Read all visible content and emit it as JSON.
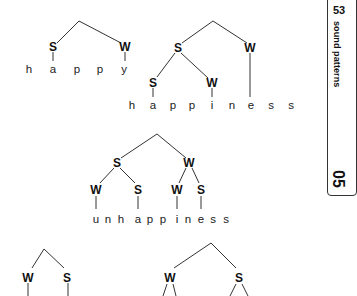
{
  "page": {
    "number": "53",
    "section_title": "sound patterns",
    "chapter": "05"
  },
  "trees": [
    {
      "word": "happy",
      "nodes": {
        "l": "S",
        "r": "W"
      },
      "segments": [
        "h",
        "a",
        "p",
        "p",
        "y"
      ]
    },
    {
      "word": "happiness",
      "nodes": {
        "l": "S",
        "r": "W",
        "ll": "S",
        "lr": "W"
      },
      "segments": [
        "h",
        "a",
        "p",
        "p",
        "i",
        "n",
        "e",
        "s",
        "s"
      ]
    },
    {
      "word": "unhappiness",
      "nodes": {
        "l": "S",
        "r": "W",
        "ll": "W",
        "lr": "S",
        "rl": "W",
        "rr": "S"
      },
      "segments": [
        "u",
        "n",
        "h",
        "a",
        "p",
        "p",
        "i",
        "n",
        "e",
        "s",
        "s"
      ]
    },
    {
      "word": "",
      "nodes": {
        "l": "W",
        "r": "S"
      },
      "segments": []
    },
    {
      "word": "",
      "nodes": {
        "l": "W",
        "r": "S"
      },
      "segments": []
    }
  ]
}
